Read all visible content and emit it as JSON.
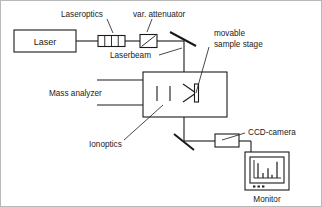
{
  "figure": {
    "background_color": "#ffffff",
    "line_color": "#1a1a1a",
    "frame_color": "#b9b9b9"
  },
  "labels": {
    "laser": "Laser",
    "laseroptics": "Laseroptics",
    "var_attenuator": "var. attenuator",
    "laserbeam": "Laserbeam",
    "movable_line1": "movable",
    "movable_line2": "sample stage",
    "mass_analyzer": "Mass analyzer",
    "ionoptics": "Ionoptics",
    "ccd_camera": "CCD-camera",
    "monitor": "Monitor"
  },
  "components": {
    "laser_source": "laser-box",
    "laseroptics_cells": 4,
    "attenuator": "variable-attenuator",
    "mirror_upper": "steering-mirror-upper",
    "mirror_lower": "steering-mirror-lower",
    "chamber": "vacuum-chamber",
    "sample_stage": "movable-sample-stage",
    "ionoptics_plates": 2,
    "ccd_camera": "ccd-camera-body",
    "monitor": "monitor-display"
  },
  "chart_data": {
    "type": "bar",
    "title": "",
    "xlabel": "",
    "ylabel": "",
    "categories": [
      "1",
      "2",
      "3",
      "4",
      "5"
    ],
    "values": [
      9,
      3,
      6,
      2,
      10
    ],
    "ylim": [
      0,
      11
    ],
    "grid": false,
    "legend": "none"
  }
}
